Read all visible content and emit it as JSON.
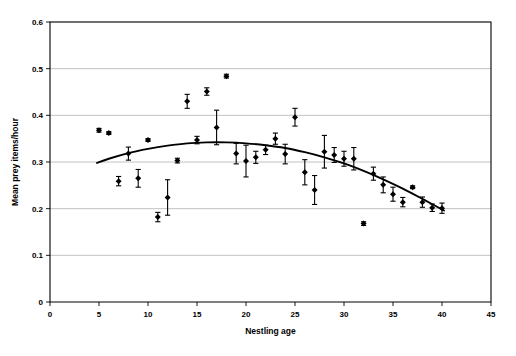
{
  "chart_data": {
    "type": "scatter",
    "title": "",
    "xlabel": "Nestling age",
    "ylabel": "Mean prey items/hour",
    "xlim": [
      0,
      45
    ],
    "ylim": [
      0,
      0.6
    ],
    "xticks": [
      0,
      5,
      10,
      15,
      20,
      25,
      30,
      35,
      40,
      45
    ],
    "xtick_labels": [
      "0",
      "5",
      "10",
      "15",
      "20",
      "25",
      "30",
      "35",
      "40",
      "45"
    ],
    "yticks": [
      0,
      0.1,
      0.2,
      0.3,
      0.4,
      0.5,
      0.6
    ],
    "ytick_labels": [
      "0",
      "0.1",
      "0.2",
      "0.3",
      "0.4",
      "0.5",
      "0.6"
    ],
    "grid": "horizontal",
    "legend": "none",
    "marker": "filled-diamond",
    "error_bars": "vertical",
    "point_color": "#000000",
    "grid_color": "#b3b3b3",
    "axis_color": "#000000",
    "fit_color": "#000000",
    "x": [
      5,
      6,
      7,
      8,
      9,
      10,
      11,
      12,
      13,
      14,
      15,
      16,
      17,
      18,
      19,
      20,
      21,
      22,
      23,
      24,
      25,
      26,
      27,
      28,
      29,
      30,
      31,
      32,
      33,
      34,
      35,
      36,
      37,
      38,
      39,
      40
    ],
    "y": [
      0.368,
      0.362,
      0.259,
      0.318,
      0.265,
      0.347,
      0.182,
      0.224,
      0.303,
      0.43,
      0.347,
      0.451,
      0.374,
      0.484,
      0.318,
      0.302,
      0.31,
      0.326,
      0.35,
      0.317,
      0.396,
      0.278,
      0.24,
      0.322,
      0.315,
      0.307,
      0.307,
      0.168,
      0.275,
      0.251,
      0.231,
      0.214,
      0.246,
      0.214,
      0.202,
      0.201
    ],
    "yerr": [
      0.004,
      0.003,
      0.01,
      0.014,
      0.019,
      0.003,
      0.01,
      0.038,
      0.005,
      0.015,
      0.008,
      0.008,
      0.037,
      0.004,
      0.022,
      0.034,
      0.013,
      0.01,
      0.012,
      0.021,
      0.019,
      0.027,
      0.031,
      0.035,
      0.016,
      0.016,
      0.024,
      0.004,
      0.014,
      0.017,
      0.015,
      0.01,
      0.003,
      0.011,
      0.008,
      0.011
    ],
    "fit": {
      "kind": "quadratic",
      "x_start": 4.8,
      "x_end": 40.2,
      "points_x": [
        4.8,
        6.0,
        8.0,
        10.0,
        12.0,
        14.0,
        16.0,
        18.0,
        20.0,
        22.0,
        24.0,
        26.0,
        28.0,
        30.0,
        32.0,
        34.0,
        36.0,
        38.0,
        40.2
      ],
      "points_y": [
        0.298,
        0.307,
        0.319,
        0.328,
        0.335,
        0.34,
        0.342,
        0.342,
        0.34,
        0.336,
        0.33,
        0.321,
        0.31,
        0.297,
        0.281,
        0.263,
        0.243,
        0.221,
        0.196
      ]
    }
  },
  "layout": {
    "plot_left": 50,
    "plot_right": 491,
    "plot_top": 22,
    "plot_bottom": 302,
    "x_axis_title_y": 334,
    "y_axis_title_x": 18
  }
}
